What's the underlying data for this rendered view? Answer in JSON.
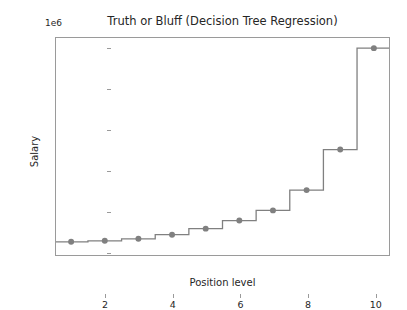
{
  "chart_data": {
    "type": "line",
    "title": "Truth or Bluff (Decision Tree Regression)",
    "xlabel": "Position level",
    "ylabel": "Salary",
    "y_offset_label": "1e6",
    "x": [
      1,
      2,
      3,
      4,
      5,
      6,
      7,
      8,
      9,
      10
    ],
    "values": [
      45000,
      50000,
      60000,
      80000,
      110000,
      150000,
      200000,
      300000,
      500000,
      1000000
    ],
    "series": [
      {
        "name": "Decision Tree Regression",
        "values": [
          45000,
          50000,
          60000,
          80000,
          110000,
          150000,
          200000,
          300000,
          500000,
          1000000
        ],
        "line_color": "#808080",
        "marker_color": "#808080",
        "marker": "circle",
        "drawstyle": "steps-mid"
      }
    ],
    "xlim": [
      0.55,
      10.45
    ],
    "ylim": [
      -0.02,
      1.05
    ],
    "y_scale_factor": 1000000,
    "xticks": [
      2,
      4,
      6,
      8,
      10
    ],
    "xtick_labels": [
      "2",
      "4",
      "6",
      "8",
      "10"
    ],
    "yticks": [
      0.0,
      0.2,
      0.4,
      0.6,
      0.8,
      1.0
    ],
    "ytick_labels": [
      "0.0",
      "0.2",
      "0.4",
      "0.6",
      "0.8",
      "1.0"
    ],
    "grid": false,
    "legend": "none",
    "annotations": []
  },
  "figure": {
    "background_color": "#ffffff",
    "axes_edge_color": "#9a9a9a",
    "text_color": "#262626"
  }
}
